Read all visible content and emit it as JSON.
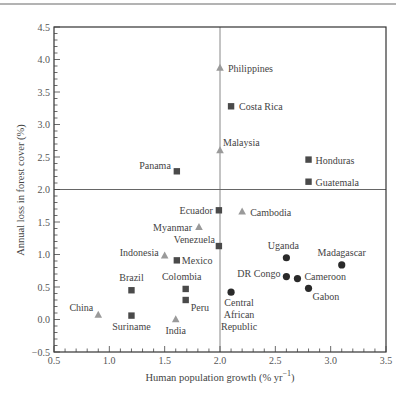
{
  "chart_data": {
    "type": "scatter",
    "title": "",
    "xlabel": "Human population growth (% yr",
    "xlabel_sup": "−1",
    "xlabel_close": ")",
    "ylabel": "Annual loss in forest cover (%)",
    "xlim": [
      0.5,
      3.5
    ],
    "ylim": [
      -0.5,
      4.5
    ],
    "x_ticks": [
      0.5,
      1.0,
      1.5,
      2.0,
      2.5,
      3.0,
      3.5
    ],
    "x_tick_labels": [
      "0.5",
      "1.0",
      "1.5",
      "2.0",
      "2.5",
      "3.0",
      "3.5"
    ],
    "y_ticks": [
      -0.5,
      0.0,
      0.5,
      1.0,
      1.5,
      2.0,
      2.5,
      3.0,
      3.5,
      4.0,
      4.5
    ],
    "y_tick_labels": [
      "−0.5",
      "0.0",
      "0.5",
      "1.0",
      "1.5",
      "2.0",
      "2.5",
      "3.0",
      "3.5",
      "4.0",
      "4.5"
    ],
    "reference_lines": {
      "x": 2.0,
      "y": 2.0
    },
    "grid": false,
    "legend": "none",
    "series": [
      {
        "name": "Asia",
        "marker": "triangle",
        "color": "#9a9a9a",
        "points": [
          {
            "label": "Philippines",
            "x": 2.0,
            "y": 3.87,
            "lx": 8,
            "ly": 4,
            "anchor": "start"
          },
          {
            "label": "Malaysia",
            "x": 2.0,
            "y": 2.6,
            "lx": 3,
            "ly": -5,
            "anchor": "start"
          },
          {
            "label": "Cambodia",
            "x": 2.2,
            "y": 1.66,
            "lx": 8,
            "ly": 4,
            "anchor": "start"
          },
          {
            "label": "Myanmar",
            "x": 1.81,
            "y": 1.42,
            "lx": -7,
            "ly": 4,
            "anchor": "end"
          },
          {
            "label": "Indonesia",
            "x": 1.5,
            "y": 0.98,
            "lx": -6,
            "ly": 0,
            "anchor": "end"
          },
          {
            "label": "China",
            "x": 0.9,
            "y": 0.07,
            "lx": -5,
            "ly": -4,
            "anchor": "end"
          },
          {
            "label": "India",
            "x": 1.6,
            "y": 0.0,
            "lx": 0,
            "ly": 14,
            "anchor": "middle"
          }
        ]
      },
      {
        "name": "Latin America",
        "marker": "square",
        "color": "#4a4a4a",
        "points": [
          {
            "label": "Costa Rica",
            "x": 2.1,
            "y": 3.28,
            "lx": 8,
            "ly": 4,
            "anchor": "start"
          },
          {
            "label": "Panama",
            "x": 1.61,
            "y": 2.28,
            "lx": -6,
            "ly": -2,
            "anchor": "end"
          },
          {
            "label": "Honduras",
            "x": 2.8,
            "y": 2.46,
            "lx": 7,
            "ly": 4,
            "anchor": "start"
          },
          {
            "label": "Guatemala",
            "x": 2.8,
            "y": 2.12,
            "lx": 7,
            "ly": 4,
            "anchor": "start"
          },
          {
            "label": "Ecuador",
            "x": 1.99,
            "y": 1.68,
            "lx": -6,
            "ly": 4,
            "anchor": "end"
          },
          {
            "label": "Venezuela",
            "x": 1.99,
            "y": 1.13,
            "lx": -4,
            "ly": -3,
            "anchor": "end"
          },
          {
            "label": "Mexico",
            "x": 1.61,
            "y": 0.91,
            "lx": 5,
            "ly": 4,
            "anchor": "start"
          },
          {
            "label": "Brazil",
            "x": 1.2,
            "y": 0.45,
            "lx": 0,
            "ly": -9,
            "anchor": "middle"
          },
          {
            "label": "Colombia",
            "x": 1.69,
            "y": 0.47,
            "lx": -4,
            "ly": -9,
            "anchor": "middle"
          },
          {
            "label": "Peru",
            "x": 1.69,
            "y": 0.3,
            "lx": 5,
            "ly": 11,
            "anchor": "start"
          },
          {
            "label": "Suriname",
            "x": 1.2,
            "y": 0.06,
            "lx": 0,
            "ly": 14,
            "anchor": "middle"
          }
        ]
      },
      {
        "name": "Africa",
        "marker": "circle",
        "color": "#2a2a2a",
        "points": [
          {
            "label": "Uganda",
            "x": 2.6,
            "y": 0.95,
            "lx": -3,
            "ly": -9,
            "anchor": "middle"
          },
          {
            "label": "DR Congo",
            "x": 2.6,
            "y": 0.66,
            "lx": -6,
            "ly": 0,
            "anchor": "end"
          },
          {
            "label": "Cameroon",
            "x": 2.7,
            "y": 0.63,
            "lx": 7,
            "ly": 1,
            "anchor": "start"
          },
          {
            "label": "Gabon",
            "x": 2.8,
            "y": 0.48,
            "lx": 4,
            "ly": 12,
            "anchor": "start"
          },
          {
            "label": "Madagascar",
            "x": 3.1,
            "y": 0.84,
            "lx": 0,
            "ly": -9,
            "anchor": "middle"
          },
          {
            "label": "Central African Republic",
            "lines": [
              "Central",
              "African",
              "Republic"
            ],
            "x": 2.1,
            "y": 0.42,
            "lx": 8,
            "ly": 14,
            "anchor": "middle"
          }
        ]
      }
    ]
  }
}
